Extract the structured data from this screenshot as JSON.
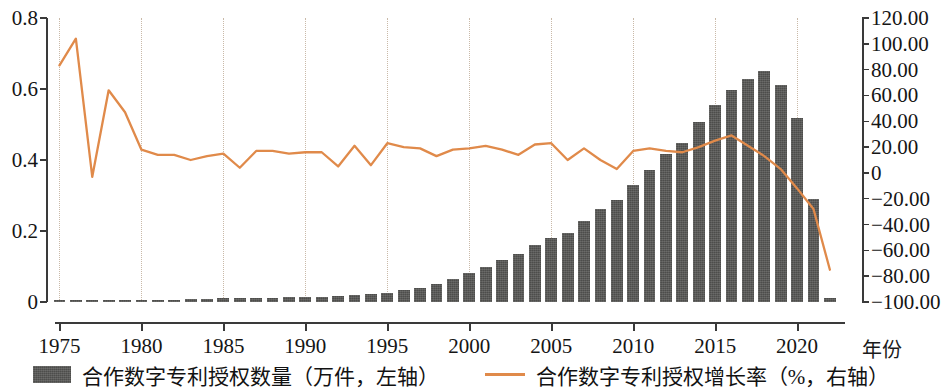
{
  "chart_data": {
    "type": "bar",
    "title": "",
    "subtitle": "",
    "xlabel": "年份",
    "ylabel_left": "",
    "ylabel_right": "",
    "grid": "vertical dotted gridlines at 5-year ticks",
    "legend_position": "bottom-center",
    "x": [
      1975,
      1976,
      1977,
      1978,
      1979,
      1980,
      1981,
      1982,
      1983,
      1984,
      1985,
      1986,
      1987,
      1988,
      1989,
      1990,
      1991,
      1992,
      1993,
      1994,
      1995,
      1996,
      1997,
      1998,
      1999,
      2000,
      2001,
      2002,
      2003,
      2004,
      2005,
      2006,
      2007,
      2008,
      2009,
      2010,
      2011,
      2012,
      2013,
      2014,
      2015,
      2016,
      2017,
      2018,
      2019,
      2020,
      2021,
      2022
    ],
    "categories": [
      "1975",
      "1976",
      "1977",
      "1978",
      "1979",
      "1980",
      "1981",
      "1982",
      "1983",
      "1984",
      "1985",
      "1986",
      "1987",
      "1988",
      "1989",
      "1990",
      "1991",
      "1992",
      "1993",
      "1994",
      "1995",
      "1996",
      "1997",
      "1998",
      "1999",
      "2000",
      "2001",
      "2002",
      "2003",
      "2004",
      "2005",
      "2006",
      "2007",
      "2008",
      "2009",
      "2010",
      "2011",
      "2012",
      "2013",
      "2014",
      "2015",
      "2016",
      "2017",
      "2018",
      "2019",
      "2020",
      "2021",
      "2022"
    ],
    "xlim": [
      1974.3,
      2022.8
    ],
    "ylim_left": [
      0,
      0.8
    ],
    "ylim_right": [
      -100,
      120
    ],
    "ytick_labels_left": [
      "0.8",
      "0.6",
      "0.4",
      "0.2",
      "0"
    ],
    "ytick_values_left": [
      0.8,
      0.6,
      0.4,
      0.2,
      0
    ],
    "ytick_labels_right": [
      "120.00",
      "100.00",
      "80.00",
      "60.00",
      "40.00",
      "20.00",
      "0",
      "−20.00",
      "−40.00",
      "−60.00",
      "−80.00",
      "−100.00"
    ],
    "ytick_values_right": [
      120,
      100,
      80,
      60,
      40,
      20,
      0,
      -20,
      -40,
      -60,
      -80,
      -100
    ],
    "xtick_labels": [
      "1975",
      "1980",
      "1985",
      "1990",
      "1995",
      "2000",
      "2005",
      "2010",
      "2015",
      "2020"
    ],
    "xtick_values": [
      1975,
      1980,
      1985,
      1990,
      1995,
      2000,
      2005,
      2010,
      2015,
      2020
    ],
    "series": [
      {
        "name": "合作数字专利授权数量（万件，左轴）",
        "type": "bar",
        "axis": "left",
        "unit": "万件",
        "color": "#4d4d4b",
        "values": [
          0.003,
          0.005,
          0.004,
          0.006,
          0.006,
          0.006,
          0.005,
          0.006,
          0.008,
          0.009,
          0.011,
          0.01,
          0.011,
          0.012,
          0.013,
          0.014,
          0.015,
          0.016,
          0.019,
          0.022,
          0.026,
          0.034,
          0.04,
          0.05,
          0.064,
          0.081,
          0.1,
          0.118,
          0.134,
          0.16,
          0.181,
          0.195,
          0.228,
          0.261,
          0.286,
          0.33,
          0.373,
          0.416,
          0.449,
          0.506,
          0.556,
          0.597,
          0.628,
          0.65,
          0.61,
          0.518,
          0.291,
          0.01
        ]
      },
      {
        "name": "合作数字专利授权增长率（%，右轴）",
        "type": "line",
        "axis": "right",
        "unit": "%",
        "color": "#e08a4a",
        "values": [
          83.3,
          104.0,
          -3.0,
          64.0,
          47.0,
          18.0,
          14.0,
          14.0,
          10.0,
          13.0,
          15.0,
          4.0,
          17.0,
          17.0,
          15.0,
          16.0,
          16.0,
          5.0,
          21.0,
          6.0,
          23.0,
          20.0,
          19.0,
          13.0,
          18.0,
          19.0,
          21.0,
          18.0,
          14.0,
          22.0,
          23.0,
          10.0,
          19.0,
          10.0,
          3.0,
          17.0,
          19.0,
          17.0,
          16.0,
          20.0,
          25.0,
          29.0,
          21.0,
          13.0,
          3.0,
          -12.0,
          -28.0,
          -75.0
        ]
      }
    ]
  },
  "legend": {
    "entries": [
      {
        "label": "合作数字专利授权数量（万件，左轴）",
        "marker": "bar-swatch"
      },
      {
        "label": "合作数字专利授权增长率（%，右轴）",
        "marker": "line-swatch"
      }
    ]
  },
  "axes": {
    "x_axis_title": "年份"
  }
}
